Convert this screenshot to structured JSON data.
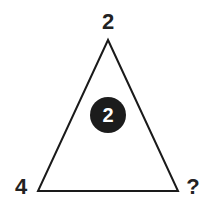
{
  "puzzle": {
    "top_vertex_label": "2",
    "bottom_left_label": "4",
    "bottom_right_label": "?",
    "center_value": "2"
  },
  "colors": {
    "line": "#1a1a1a",
    "circle_fill": "#1c1c1c",
    "circle_text": "#ffffff",
    "background": "#ffffff"
  }
}
